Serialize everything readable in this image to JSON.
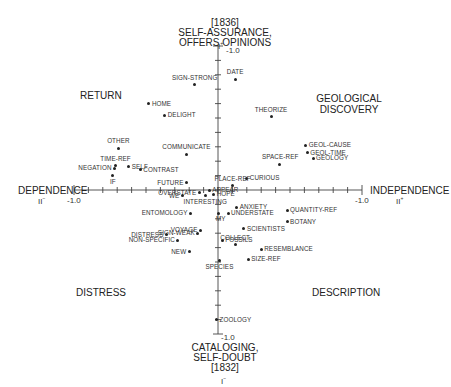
{
  "chart_data": {
    "type": "scatter",
    "title": "",
    "axes": {
      "vertical": {
        "name": "I",
        "top_label": "SELF-ASSURANCE, OFFERS OPINIONS",
        "top_year": "[1836]",
        "top_symbol": "I+",
        "bottom_label": "CATALOGING, SELF-DOUBT",
        "bottom_year": "[1832]",
        "bottom_symbol": "I-",
        "range": [
          -1.0,
          1.0
        ],
        "top_tick": "1.0",
        "bottom_tick": "-1.0"
      },
      "horizontal": {
        "name": "II",
        "left_label": "DEPENDENCE",
        "left_symbol": "II-",
        "right_label": "INDEPENDENCE",
        "right_symbol": "II+",
        "range": [
          -1.0,
          1.0
        ],
        "left_tick": "-1.0",
        "right_tick": "1.0"
      }
    },
    "quadrant_labels": [
      {
        "text": "RETURN",
        "position": "upper-left"
      },
      {
        "text": "GEOLOGICAL DISCOVERY",
        "position": "upper-right"
      },
      {
        "text": "DISTRESS",
        "position": "lower-left"
      },
      {
        "text": "DESCRIPTION",
        "position": "lower-right"
      }
    ],
    "points": [
      {
        "label": "SIGN-STRONG",
        "x": -0.16,
        "y": 0.73
      },
      {
        "label": "DATE",
        "x": 0.12,
        "y": 0.77
      },
      {
        "label": "HOME",
        "x": -0.48,
        "y": 0.6
      },
      {
        "label": "DELIGHT",
        "x": -0.37,
        "y": 0.52
      },
      {
        "label": "THEORIZE",
        "x": 0.37,
        "y": 0.51
      },
      {
        "label": "GEOL-CAUSE",
        "x": 0.61,
        "y": 0.31
      },
      {
        "label": "GEOL-TIME",
        "x": 0.62,
        "y": 0.26
      },
      {
        "label": "GEOLOGY",
        "x": 0.66,
        "y": 0.22
      },
      {
        "label": "SPACE-REF",
        "x": 0.43,
        "y": 0.18
      },
      {
        "label": "OTHER",
        "x": -0.69,
        "y": 0.29
      },
      {
        "label": "COMMUNICATE",
        "x": -0.22,
        "y": 0.25
      },
      {
        "label": "TIME-REF",
        "x": -0.71,
        "y": 0.17
      },
      {
        "label": "NEGATION",
        "x": -0.72,
        "y": 0.15
      },
      {
        "label": "SELF",
        "x": -0.62,
        "y": 0.16
      },
      {
        "label": "CONTRAST",
        "x": -0.54,
        "y": 0.14
      },
      {
        "label": "IF",
        "x": -0.73,
        "y": 0.1
      },
      {
        "label": "CURIOUS",
        "x": 0.2,
        "y": 0.08
      },
      {
        "label": "PLACE-REF",
        "x": 0.1,
        "y": 0.03
      },
      {
        "label": "FUTURE",
        "x": -0.22,
        "y": 0.05
      },
      {
        "label": "OVERSTATE",
        "x": -0.13,
        "y": -0.02
      },
      {
        "label": "APPEAR",
        "x": -0.06,
        "y": 0.0
      },
      {
        "label": "WE",
        "x": -0.25,
        "y": -0.04
      },
      {
        "label": "INTERESTING",
        "x": -0.09,
        "y": -0.04
      },
      {
        "label": "HOPE",
        "x": -0.03,
        "y": -0.03
      },
      {
        "label": "ANXIETY",
        "x": 0.13,
        "y": -0.12
      },
      {
        "label": "QUANTITY-REF",
        "x": 0.48,
        "y": -0.14
      },
      {
        "label": "UNDERSTATE",
        "x": 0.07,
        "y": -0.16
      },
      {
        "label": "MY",
        "x": 0.0,
        "y": -0.16
      },
      {
        "label": "ENTOMOLOGY",
        "x": -0.19,
        "y": -0.16
      },
      {
        "label": "BOTANY",
        "x": 0.48,
        "y": -0.22
      },
      {
        "label": "VOYAGE",
        "x": -0.12,
        "y": -0.28
      },
      {
        "label": "SIGN-WEAK",
        "x": -0.14,
        "y": -0.3
      },
      {
        "label": "DISTRESS",
        "x": -0.36,
        "y": -0.31
      },
      {
        "label": "SCIENTISTS",
        "x": 0.18,
        "y": -0.27
      },
      {
        "label": "NON-SPECIFIC",
        "x": -0.28,
        "y": -0.35
      },
      {
        "label": "FOSSILS",
        "x": 0.03,
        "y": -0.35
      },
      {
        "label": "COLLECT",
        "x": 0.12,
        "y": -0.38
      },
      {
        "label": "RESEMBLANCE",
        "x": 0.3,
        "y": -0.41
      },
      {
        "label": "NEW",
        "x": -0.2,
        "y": -0.43
      },
      {
        "label": "SPECIES",
        "x": 0.01,
        "y": -0.49
      },
      {
        "label": "SIZE-REF",
        "x": 0.21,
        "y": -0.48
      },
      {
        "label": "ZOOLOGY",
        "x": -0.01,
        "y": -0.9
      }
    ],
    "grid": false,
    "legend": null
  }
}
